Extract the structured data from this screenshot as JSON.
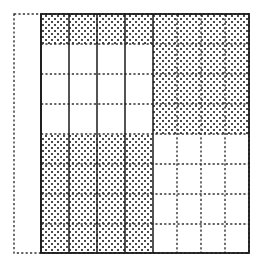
{
  "figure": {
    "title": ""
  },
  "chart_data": {
    "type": "heatmap",
    "title": "",
    "subtitle": "",
    "xlabel": "",
    "ylabel": "",
    "grid": true,
    "legend": null,
    "annotations": [],
    "cell_states": [
      "shaded",
      "empty"
    ],
    "state_colors": {
      "shaded": "#555555",
      "empty": "#ffffff"
    },
    "n_rows": 8,
    "n_cols": 8,
    "col_labels": [
      "c1",
      "c2",
      "c3",
      "c4",
      "c5",
      "c6",
      "c7",
      "c8"
    ],
    "row_labels": [
      "r1",
      "r2",
      "r3",
      "r4",
      "r5",
      "r6",
      "r7",
      "r8"
    ],
    "xlim": [
      0,
      8
    ],
    "ylim": [
      0,
      8
    ],
    "values": [
      [
        1,
        1,
        1,
        1,
        1,
        1,
        1,
        1
      ],
      [
        0,
        0,
        0,
        0,
        1,
        1,
        1,
        1
      ],
      [
        0,
        0,
        0,
        0,
        1,
        1,
        1,
        1
      ],
      [
        0,
        0,
        0,
        0,
        1,
        1,
        1,
        1
      ],
      [
        1,
        1,
        1,
        1,
        0,
        0,
        0,
        0
      ],
      [
        1,
        1,
        1,
        1,
        0,
        0,
        0,
        0
      ],
      [
        1,
        1,
        1,
        1,
        0,
        0,
        0,
        0
      ],
      [
        1,
        1,
        1,
        1,
        0,
        0,
        0,
        0
      ]
    ],
    "col_x": [
      41,
      69,
      97,
      125,
      153,
      177,
      201,
      225,
      249
    ],
    "row_y": [
      14,
      44,
      74,
      104,
      134,
      164,
      194,
      224,
      253
    ],
    "solid_col_lines": [
      41,
      69,
      97,
      125,
      153
    ],
    "dotted_col_lines": [
      177,
      201,
      225
    ],
    "dotted_row_lines": [
      44,
      74,
      104,
      134,
      164,
      194,
      224
    ],
    "outer_border": {
      "x": 41,
      "y": 14,
      "width": 208,
      "height": 239,
      "style": "solid"
    },
    "outer_dotted_box": {
      "x": 14,
      "y": 14,
      "width": 235,
      "height": 239,
      "style": "dotted"
    }
  }
}
